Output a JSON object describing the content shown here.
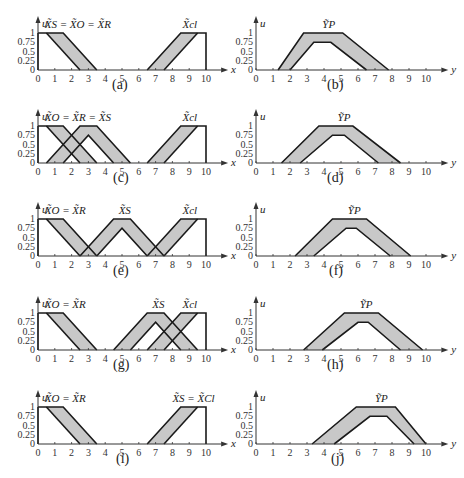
{
  "chart_data": [
    {
      "panel": "(a)",
      "type": "area",
      "xlabel": "x",
      "ylabel": "u",
      "xlim": [
        0,
        10
      ],
      "ylim": [
        0,
        1
      ],
      "xticks": [
        "0",
        "1",
        "2",
        "3",
        "4",
        "5",
        "6",
        "7",
        "8",
        "9",
        "10"
      ],
      "yticks": [
        "0",
        "0.25",
        "0.5",
        "0.75",
        "1"
      ],
      "annotations": [
        {
          "text": "X̃S = X̃O = X̃R",
          "x": 0.4
        },
        {
          "text": "X̃cl",
          "x": 8.6
        }
      ],
      "sets": [
        {
          "name": "X_S=X_O=X_R",
          "upper": [
            [
              0,
              1
            ],
            [
              1.5,
              1
            ],
            [
              3.5,
              0
            ]
          ],
          "lower": [
            [
              0.5,
              1
            ],
            [
              2.5,
              0
            ]
          ],
          "left_edge": true
        },
        {
          "name": "X_cl",
          "upper": [
            [
              6.5,
              0
            ],
            [
              8.5,
              1
            ],
            [
              10,
              1
            ],
            [
              10,
              0
            ]
          ],
          "lower": [
            [
              7.5,
              0
            ],
            [
              9.5,
              1
            ]
          ]
        }
      ]
    },
    {
      "panel": "(b)",
      "type": "area",
      "xlabel": "y",
      "ylabel": "u",
      "xlim": [
        0,
        10
      ],
      "ylim": [
        0,
        1
      ],
      "annotations": [
        {
          "text": "ỸP",
          "x": 3.9
        }
      ],
      "sets": [
        {
          "name": "Y_P",
          "upper": [
            [
              1.3,
              0
            ],
            [
              2.8,
              1
            ],
            [
              5.1,
              1
            ],
            [
              7.8,
              0
            ]
          ],
          "lower": [
            [
              2,
              0
            ],
            [
              3.4,
              0.75
            ],
            [
              4.4,
              0.75
            ],
            [
              6.5,
              0
            ]
          ]
        }
      ]
    },
    {
      "panel": "(c)",
      "type": "area",
      "xlabel": "x",
      "ylabel": "u",
      "xlim": [
        0,
        10
      ],
      "ylim": [
        0,
        1
      ],
      "annotations": [
        {
          "text": "X̃O = X̃R = X̃S",
          "x": 0.4
        },
        {
          "text": "X̃cl",
          "x": 8.6
        }
      ],
      "sets": [
        {
          "name": "X_O=X_R",
          "upper": [
            [
              0,
              1
            ],
            [
              1.5,
              1
            ],
            [
              3.5,
              0
            ]
          ],
          "lower": [
            [
              0.5,
              1
            ],
            [
              2.5,
              0
            ]
          ],
          "left_edge": true
        },
        {
          "name": "X_S",
          "upper": [
            [
              0.5,
              0
            ],
            [
              2.5,
              1
            ],
            [
              3.5,
              1
            ],
            [
              5.5,
              0
            ]
          ],
          "lower": [
            [
              1.5,
              0
            ],
            [
              3,
              0.75
            ],
            [
              4.5,
              0
            ]
          ]
        },
        {
          "name": "X_cl",
          "upper": [
            [
              6.5,
              0
            ],
            [
              8.5,
              1
            ],
            [
              10,
              1
            ],
            [
              10,
              0
            ]
          ],
          "lower": [
            [
              7.5,
              0
            ],
            [
              9.5,
              1
            ]
          ]
        }
      ]
    },
    {
      "panel": "(d)",
      "type": "area",
      "xlabel": "y",
      "ylabel": "u",
      "xlim": [
        0,
        10
      ],
      "ylim": [
        0,
        1
      ],
      "annotations": [
        {
          "text": "ỸP",
          "x": 4.8
        }
      ],
      "sets": [
        {
          "name": "Y_P",
          "upper": [
            [
              1.5,
              0
            ],
            [
              3.7,
              1
            ],
            [
              5.7,
              1
            ],
            [
              8.5,
              0
            ]
          ],
          "lower": [
            [
              2.6,
              0
            ],
            [
              4.5,
              0.75
            ],
            [
              5.2,
              0.75
            ],
            [
              7.2,
              0
            ]
          ]
        }
      ]
    },
    {
      "panel": "(e)",
      "type": "area",
      "xlabel": "x",
      "ylabel": "u",
      "xlim": [
        0,
        10
      ],
      "ylim": [
        0,
        1
      ],
      "annotations": [
        {
          "text": "X̃O = X̃R",
          "x": 0.4
        },
        {
          "text": "X̃S",
          "x": 4.8
        },
        {
          "text": "X̃cl",
          "x": 8.6
        }
      ],
      "sets": [
        {
          "name": "X_O=X_R",
          "upper": [
            [
              0,
              1
            ],
            [
              1.5,
              1
            ],
            [
              3.5,
              0
            ]
          ],
          "lower": [
            [
              0.5,
              1
            ],
            [
              2.5,
              0
            ]
          ],
          "left_edge": true
        },
        {
          "name": "X_S",
          "upper": [
            [
              2.5,
              0
            ],
            [
              4.5,
              1
            ],
            [
              5.5,
              1
            ],
            [
              7.5,
              0
            ]
          ],
          "lower": [
            [
              3.5,
              0
            ],
            [
              5,
              0.75
            ],
            [
              6.5,
              0
            ]
          ]
        },
        {
          "name": "X_cl",
          "upper": [
            [
              6.5,
              0
            ],
            [
              8.5,
              1
            ],
            [
              10,
              1
            ],
            [
              10,
              0
            ]
          ],
          "lower": [
            [
              7.5,
              0
            ],
            [
              9.5,
              1
            ]
          ]
        }
      ]
    },
    {
      "panel": "(f)",
      "type": "area",
      "xlabel": "y",
      "ylabel": "u",
      "xlim": [
        0,
        10
      ],
      "ylim": [
        0,
        1
      ],
      "annotations": [
        {
          "text": "ỸP",
          "x": 5.4
        }
      ],
      "sets": [
        {
          "name": "Y_P",
          "upper": [
            [
              2.3,
              0
            ],
            [
              4.5,
              1
            ],
            [
              6.5,
              1
            ],
            [
              9.1,
              0
            ]
          ],
          "lower": [
            [
              3.4,
              0
            ],
            [
              5.3,
              0.75
            ],
            [
              5.9,
              0.75
            ],
            [
              7.9,
              0
            ]
          ]
        }
      ]
    },
    {
      "panel": "(g)",
      "type": "area",
      "xlabel": "x",
      "ylabel": "u",
      "xlim": [
        0,
        10
      ],
      "ylim": [
        0,
        1
      ],
      "annotations": [
        {
          "text": "X̃O = X̃R",
          "x": 0.4
        },
        {
          "text": "X̃S",
          "x": 6.8
        },
        {
          "text": "X̃cl",
          "x": 8.6
        }
      ],
      "sets": [
        {
          "name": "X_O=X_R",
          "upper": [
            [
              0,
              1
            ],
            [
              1.5,
              1
            ],
            [
              3.5,
              0
            ]
          ],
          "lower": [
            [
              0.5,
              1
            ],
            [
              2.5,
              0
            ]
          ],
          "left_edge": true
        },
        {
          "name": "X_S",
          "upper": [
            [
              4.5,
              0
            ],
            [
              6.5,
              1
            ],
            [
              7.5,
              1
            ],
            [
              9.5,
              0
            ]
          ],
          "lower": [
            [
              5.5,
              0
            ],
            [
              7,
              0.75
            ],
            [
              8.5,
              0
            ]
          ]
        },
        {
          "name": "X_cl",
          "upper": [
            [
              6.5,
              0
            ],
            [
              8.5,
              1
            ],
            [
              10,
              1
            ],
            [
              10,
              0
            ]
          ],
          "lower": [
            [
              7.5,
              0
            ],
            [
              9.5,
              1
            ]
          ]
        }
      ]
    },
    {
      "panel": "(h)",
      "type": "area",
      "xlabel": "y",
      "ylabel": "u",
      "xlim": [
        0,
        10
      ],
      "ylim": [
        0,
        1
      ],
      "annotations": [
        {
          "text": "ỸP",
          "x": 6.1
        }
      ],
      "sets": [
        {
          "name": "Y_P",
          "upper": [
            [
              2.8,
              0
            ],
            [
              5.2,
              1
            ],
            [
              7.2,
              1
            ],
            [
              9.8,
              0
            ]
          ],
          "lower": [
            [
              3.9,
              0
            ],
            [
              6,
              0.75
            ],
            [
              6.6,
              0.75
            ],
            [
              8.5,
              0
            ]
          ]
        }
      ]
    },
    {
      "panel": "(i)",
      "type": "area",
      "xlabel": "x",
      "ylabel": "u",
      "xlim": [
        0,
        10
      ],
      "ylim": [
        0,
        1
      ],
      "annotations": [
        {
          "text": "X̃O = X̃R",
          "x": 0.4
        },
        {
          "text": "X̃S = X̃Cl",
          "x": 8.0
        }
      ],
      "sets": [
        {
          "name": "X_O=X_R",
          "upper": [
            [
              0,
              1
            ],
            [
              1.5,
              1
            ],
            [
              3.5,
              0
            ]
          ],
          "lower": [
            [
              0.5,
              1
            ],
            [
              2.5,
              0
            ]
          ],
          "left_edge": true
        },
        {
          "name": "X_S=X_Cl",
          "upper": [
            [
              6.5,
              0
            ],
            [
              8.5,
              1
            ],
            [
              10,
              1
            ],
            [
              10,
              0
            ]
          ],
          "lower": [
            [
              7.5,
              0
            ],
            [
              9.5,
              1
            ]
          ]
        }
      ]
    },
    {
      "panel": "(j)",
      "type": "area",
      "xlabel": "y",
      "ylabel": "u",
      "xlim": [
        0,
        10
      ],
      "ylim": [
        0,
        1
      ],
      "annotations": [
        {
          "text": "ỸP",
          "x": 7.0
        }
      ],
      "sets": [
        {
          "name": "Y_P",
          "upper": [
            [
              3.3,
              0
            ],
            [
              5.9,
              1
            ],
            [
              8.2,
              1
            ],
            [
              10,
              0
            ]
          ],
          "lower": [
            [
              4.6,
              0
            ],
            [
              6.7,
              0.75
            ],
            [
              7.7,
              0.75
            ],
            [
              9.3,
              0
            ]
          ]
        }
      ]
    }
  ],
  "labels": {
    "a": "(a)",
    "b": "(b)",
    "c": "(c)",
    "d": "(d)",
    "e": "(e)",
    "f": "(f)",
    "g": "(g)",
    "h": "(h)",
    "i": "(i)",
    "j": "(j)"
  },
  "colors": {
    "fill": "#c8c8c8",
    "line": "#1a1a1a",
    "axis": "#333333"
  }
}
